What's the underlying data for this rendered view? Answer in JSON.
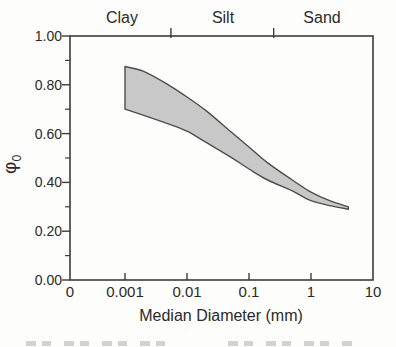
{
  "figure": {
    "top_axis": {
      "categories": [
        {
          "label": "Clay"
        },
        {
          "label": "Silt"
        },
        {
          "label": "Sand"
        }
      ],
      "boundaries_mm": [
        0.0055,
        0.25
      ]
    },
    "y_axis": {
      "symbol": "φ",
      "subscript": "0",
      "ticks": [
        {
          "label": "1.00",
          "phi": 1.0
        },
        {
          "label": "0.80",
          "phi": 0.8
        },
        {
          "label": "0.60",
          "phi": 0.6
        },
        {
          "label": "0.40",
          "phi": 0.4
        },
        {
          "label": "0.20",
          "phi": 0.2
        },
        {
          "label": "0.00",
          "phi": 0.0
        }
      ],
      "minor_tick_phis": [
        0.9,
        0.7,
        0.5,
        0.3,
        0.1
      ]
    },
    "x_axis": {
      "title": "Median Diameter (mm)",
      "ticks": [
        {
          "label": "0",
          "mm": null,
          "x_px": 70,
          "mark": false
        },
        {
          "label": "0.001",
          "mm": 0.001,
          "mark": true
        },
        {
          "label": "0.01",
          "mm": 0.01,
          "mark": true
        },
        {
          "label": "0.1",
          "mm": 0.1,
          "mark": true
        },
        {
          "label": "1",
          "mm": 1,
          "mark": true
        },
        {
          "label": "10",
          "mm": 10,
          "mark": false
        }
      ]
    },
    "colors": {
      "band_fill": "#c8c8c8",
      "band_edge": "#4d4d4d",
      "axis": "#3c3c3c",
      "text": "#2a2a2a",
      "background": "#fdfdfb"
    }
  },
  "chart_data": {
    "type": "area",
    "title": "",
    "xlabel": "Median Diameter (mm)",
    "ylabel": "φ₀",
    "x_scale": "log",
    "xlim": [
      0.001,
      10
    ],
    "ylim": [
      0.0,
      1.0
    ],
    "x_origin_label": "0",
    "top_axis_categories": [
      "Clay",
      "Silt",
      "Sand"
    ],
    "y_major_step": 0.2,
    "y_minor_step": 0.1,
    "band": {
      "x_mm": [
        0.001,
        0.002,
        0.005,
        0.01,
        0.02,
        0.05,
        0.1,
        0.2,
        0.5,
        1,
        2,
        4
      ],
      "upper_phi": [
        0.875,
        0.855,
        0.8,
        0.75,
        0.695,
        0.61,
        0.545,
        0.48,
        0.41,
        0.36,
        0.325,
        0.3
      ],
      "lower_phi": [
        0.7,
        0.675,
        0.64,
        0.61,
        0.565,
        0.505,
        0.455,
        0.41,
        0.365,
        0.325,
        0.305,
        0.29
      ]
    }
  }
}
